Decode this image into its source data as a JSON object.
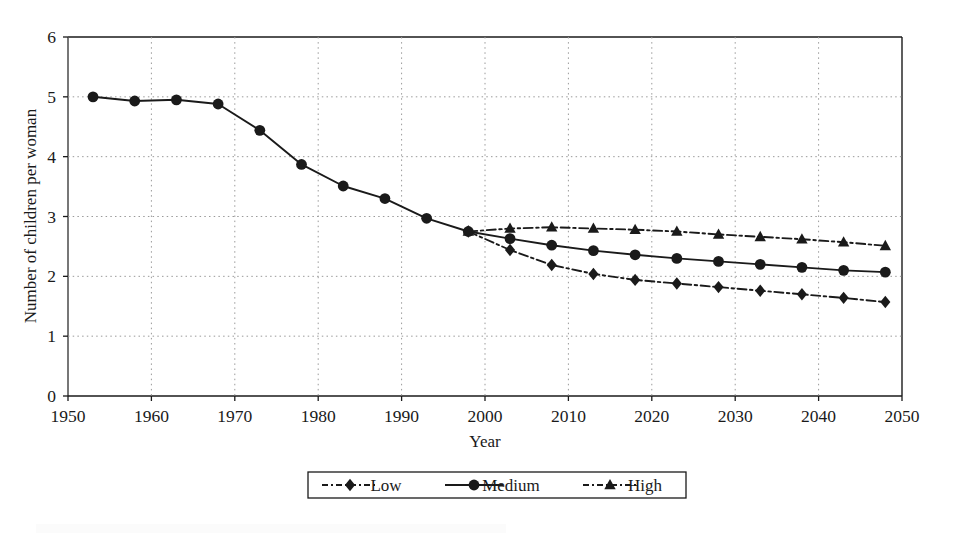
{
  "chart_data": {
    "type": "line",
    "title": "",
    "xlabel": "Year",
    "ylabel": "Number of children per woman",
    "xlim": [
      1950,
      2050
    ],
    "ylim": [
      0,
      6
    ],
    "xticks": [
      1950,
      1960,
      1970,
      1980,
      1990,
      2000,
      2010,
      2020,
      2030,
      2040,
      2050
    ],
    "yticks": [
      0,
      1,
      2,
      3,
      4,
      5,
      6
    ],
    "grid": "dotted-both-axes",
    "legend_position": "below-plot-center",
    "x": [
      1953,
      1958,
      1963,
      1968,
      1973,
      1978,
      1983,
      1988,
      1993,
      1998,
      2003,
      2008,
      2013,
      2018,
      2023,
      2028,
      2033,
      2038,
      2043,
      2048
    ],
    "series": [
      {
        "name": "Low",
        "marker": "diamond",
        "line_style": "dash-dot",
        "color": "#1a1a1a",
        "values": [
          null,
          null,
          null,
          null,
          null,
          null,
          null,
          null,
          null,
          2.75,
          2.44,
          2.19,
          2.04,
          1.94,
          1.88,
          1.82,
          1.76,
          1.7,
          1.64,
          1.57
        ]
      },
      {
        "name": "Medium",
        "marker": "circle",
        "line_style": "solid",
        "color": "#1a1a1a",
        "values": [
          5.0,
          4.93,
          4.95,
          4.88,
          4.44,
          3.87,
          3.51,
          3.3,
          2.97,
          2.75,
          2.63,
          2.52,
          2.43,
          2.36,
          2.3,
          2.25,
          2.2,
          2.15,
          2.1,
          2.07
        ]
      },
      {
        "name": "High",
        "marker": "triangle",
        "line_style": "dash-dot",
        "color": "#1a1a1a",
        "values": [
          null,
          null,
          null,
          null,
          null,
          null,
          null,
          null,
          null,
          2.75,
          2.8,
          2.82,
          2.8,
          2.78,
          2.75,
          2.7,
          2.66,
          2.62,
          2.57,
          2.51
        ]
      }
    ]
  },
  "axes": {
    "y_title": "Number of children per woman",
    "x_title": "Year",
    "y_tick_labels": [
      "6",
      "5",
      "4",
      "3",
      "2",
      "1",
      "0"
    ],
    "x_tick_labels": [
      "1950",
      "1960",
      "1970",
      "1980",
      "1990",
      "2000",
      "2010",
      "2020",
      "2030",
      "2040",
      "2050"
    ]
  },
  "legend": {
    "entries": [
      {
        "label": "Low",
        "marker": "diamond-marker-icon",
        "style": "dash-dot"
      },
      {
        "label": "Medium",
        "marker": "circle-marker-icon",
        "style": "solid"
      },
      {
        "label": "High",
        "marker": "triangle-marker-icon",
        "style": "dash-dot"
      }
    ]
  },
  "colors": {
    "ink": "#1a1a1a",
    "grid": "#9a9a9a",
    "background": "#ffffff"
  }
}
